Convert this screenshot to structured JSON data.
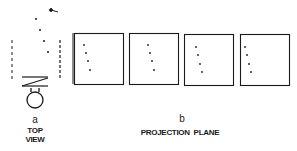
{
  "figure": {
    "panel_a": {
      "letter": "a",
      "caption_line1": "TOP",
      "caption_line2": "VIEW"
    },
    "panel_b": {
      "letter": "b",
      "caption": "PROJECTION  PLANE",
      "frames": [
        {
          "index": 1,
          "dots": [
            [
              84,
              45
            ],
            [
              86,
              53
            ],
            [
              88,
              61
            ],
            [
              90,
              70
            ]
          ]
        },
        {
          "index": 2,
          "dots": [
            [
              148,
              45
            ],
            [
              150,
              53
            ],
            [
              152,
              61
            ],
            [
              154,
              70
            ]
          ]
        },
        {
          "index": 3,
          "dots": [
            [
              196,
              47
            ],
            [
              198,
              55
            ],
            [
              200,
              64
            ],
            [
              202,
              72
            ]
          ]
        },
        {
          "index": 4,
          "dots": [
            [
              245,
              47
            ],
            [
              247,
              55
            ],
            [
              249,
              64
            ],
            [
              251,
              72
            ]
          ]
        }
      ]
    },
    "colors": {
      "ink": "#1a1a1a",
      "background": "#ffffff"
    }
  }
}
